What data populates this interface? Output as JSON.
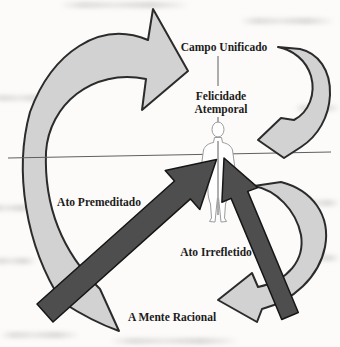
{
  "diagram": {
    "labels": {
      "campo_unificado": "Campo Unificado",
      "felicidade": "Felicidade",
      "atemporal": "Atemporal",
      "ato_premeditado": "Ato Premeditado",
      "ato_irrefletido": "Ato Irrefletido",
      "a_mente_racional": "A Mente Racional"
    },
    "icons": {
      "human_figure": "standing-person-outline-icon",
      "left_curved_arrow": "large-curved-arrow-icon",
      "top_right_curved_arrow": "curved-return-arrow-icon",
      "bottom_right_curved_arrow": "curved-return-arrow-icon",
      "premeditated_arrow": "thick-diagonal-arrow-icon",
      "unreflected_arrow": "thick-diagonal-arrow-icon"
    },
    "colors": {
      "background": "#fcfbf9",
      "light_arrow_fill": "#d2d2d2",
      "outline": "#2b2b2b",
      "dark_arrow_fill": "#4e4e4e",
      "axis_line": "#5f5f5f",
      "figure_outline": "#9b9b9b",
      "text": "#1c1c1c"
    }
  }
}
